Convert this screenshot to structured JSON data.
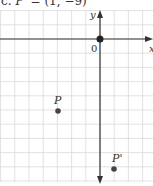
{
  "caption": {
    "label": "c.",
    "point_name": "P'",
    "equals": " = ",
    "coords": "(1, −9)"
  },
  "axes": {
    "x_label": "x",
    "y_label": "y",
    "origin_label": "0"
  },
  "points": {
    "p": {
      "label": "P",
      "x": -3,
      "y": -5
    },
    "p_prime": {
      "label": "P'",
      "x": 1,
      "y": -9
    }
  },
  "colors": {
    "grid": "#d9d9d9",
    "axis": "#333333",
    "point": "#333333",
    "text": "#333333"
  },
  "chart_data": {
    "type": "scatter",
    "title": "c. P' = (1, −9)",
    "xlabel": "x",
    "ylabel": "y",
    "series": [
      {
        "name": "P",
        "x": [
          -3
        ],
        "y": [
          -5
        ]
      },
      {
        "name": "P'",
        "x": [
          1
        ],
        "y": [
          -9
        ]
      },
      {
        "name": "origin",
        "x": [
          0
        ],
        "y": [
          0
        ]
      }
    ],
    "xlim": [
      -7,
      3.5
    ],
    "ylim": [
      -10,
      2.5
    ],
    "grid": true,
    "grid_unit": 1,
    "annotations": [
      "0",
      "P",
      "P'"
    ]
  }
}
